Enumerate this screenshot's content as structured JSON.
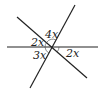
{
  "diagram": {
    "type": "intersecting-lines",
    "lines": [
      {
        "name": "horizontal",
        "x1": 7,
        "y1": 47,
        "x2": 98,
        "y2": 47
      },
      {
        "name": "steep",
        "x1": 75,
        "y1": 5,
        "x2": 30,
        "y2": 88
      },
      {
        "name": "diagonal",
        "x1": 17,
        "y1": 17,
        "x2": 87,
        "y2": 78
      }
    ],
    "intersection": {
      "x": 52,
      "y": 47
    },
    "angle_labels": [
      {
        "text": "4x",
        "x": 45,
        "y": 38
      },
      {
        "text": "2x",
        "x": 31,
        "y": 46
      },
      {
        "text": "3x",
        "x": 33,
        "y": 59
      },
      {
        "text": "2x",
        "x": 66,
        "y": 57
      }
    ],
    "colors": {
      "line": "#222222",
      "background": "#ffffff"
    }
  }
}
